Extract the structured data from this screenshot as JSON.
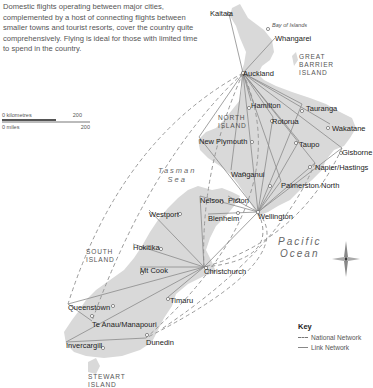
{
  "intro_text": "Domestic flights operating between major cities, complemented by a host of connecting flights between smaller towns and tourist resorts, cover the country quite comprehensively. Flying is ideal for those with limited time to spend in the country.",
  "scale": {
    "km_start": "0 kilometres",
    "km_end": "200",
    "mi_start": "0 miles",
    "mi_end": "200"
  },
  "regions": {
    "north_island": [
      "NORTH",
      "ISLAND"
    ],
    "south_island": [
      "SOUTH",
      "ISLAND"
    ],
    "great_barrier": [
      "GREAT",
      "BARRIER",
      "ISLAND"
    ],
    "stewart": [
      "STEWART",
      "ISLAND"
    ],
    "bay_of_islands": "Bay of Islands"
  },
  "seas": {
    "tasman": [
      "Tasman",
      "Sea"
    ],
    "pacific": [
      "Pacific",
      "Ocean"
    ]
  },
  "cities": [
    {
      "name": "Kaitaia",
      "x": 229,
      "y": 14
    },
    {
      "name": "Whangarei",
      "x": 275,
      "y": 38
    },
    {
      "name": "Auckland",
      "x": 243,
      "y": 73
    },
    {
      "name": "Hamilton",
      "x": 251,
      "y": 101
    },
    {
      "name": "Tauranga",
      "x": 302,
      "y": 104
    },
    {
      "name": "Rotorua",
      "x": 273,
      "y": 117
    },
    {
      "name": "Wakatane",
      "x": 330,
      "y": 124
    },
    {
      "name": "Taupo",
      "x": 299,
      "y": 141
    },
    {
      "name": "Gisborne",
      "x": 342,
      "y": 148
    },
    {
      "name": "New Plymouth",
      "x": 199,
      "y": 137
    },
    {
      "name": "Napier/Hastings",
      "x": 315,
      "y": 163
    },
    {
      "name": "Wanganui",
      "x": 231,
      "y": 170
    },
    {
      "name": "Palmerston North",
      "x": 281,
      "y": 181
    },
    {
      "name": "Nelson",
      "x": 200,
      "y": 196
    },
    {
      "name": "Picton",
      "x": 228,
      "y": 196
    },
    {
      "name": "Wellington",
      "x": 258,
      "y": 212
    },
    {
      "name": "Blenheim",
      "x": 208,
      "y": 214
    },
    {
      "name": "Westport",
      "x": 149,
      "y": 210
    },
    {
      "name": "Hokitika",
      "x": 133,
      "y": 244
    },
    {
      "name": "Mt Cook",
      "x": 140,
      "y": 267
    },
    {
      "name": "Christchurch",
      "x": 204,
      "y": 267
    },
    {
      "name": "Timaru",
      "x": 168,
      "y": 297
    },
    {
      "name": "Queenstown",
      "x": 68,
      "y": 304
    },
    {
      "name": "Te Anau/Manapouri",
      "x": 92,
      "y": 321
    },
    {
      "name": "Invercargill",
      "x": 66,
      "y": 342
    },
    {
      "name": "Dunedin",
      "x": 146,
      "y": 338
    }
  ],
  "key": {
    "title": "Key",
    "national": "National Network",
    "link": "Link Network"
  },
  "colors": {
    "land": "#d9d9d9",
    "route": "#8a8a8a",
    "text": "#222222"
  }
}
